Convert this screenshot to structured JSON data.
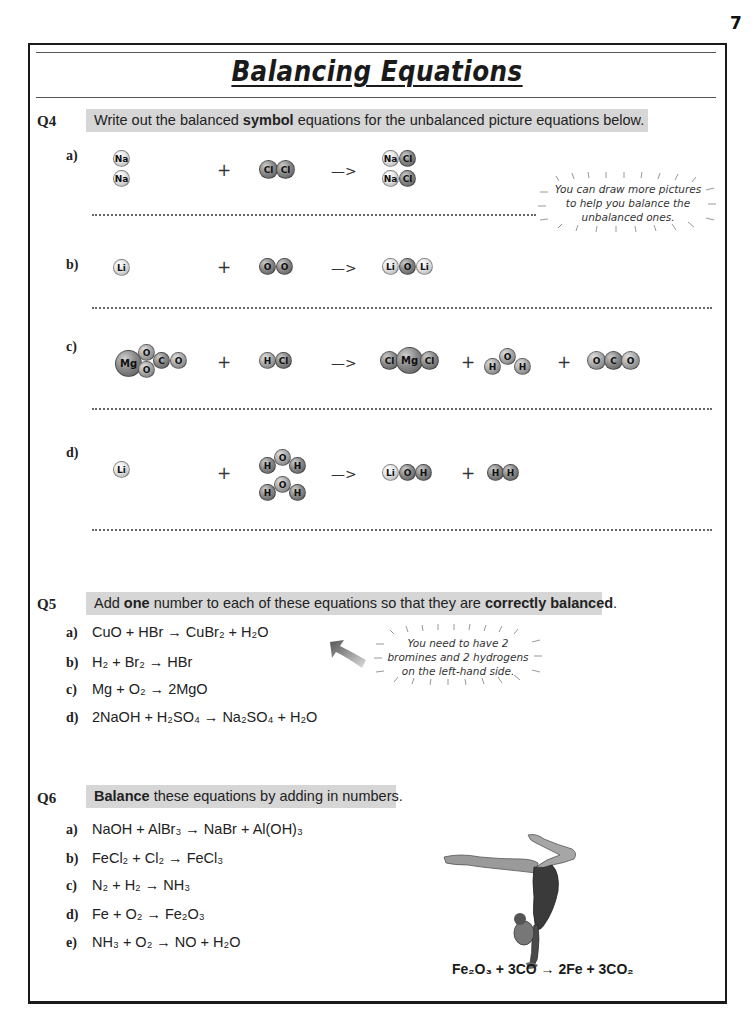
{
  "page_number": "7",
  "title": "Balancing Equations",
  "q4": {
    "label": "Q4",
    "instruction_pre": "Write out the balanced ",
    "instruction_bold": "symbol",
    "instruction_post": " equations for the unbalanced picture equations below.",
    "parts": [
      {
        "label": "a)",
        "reactants": [
          [
            "Na"
          ],
          [
            "Na"
          ]
        ],
        "reactant2": [
          "Cl",
          "Cl"
        ],
        "products": [
          [
            "Na",
            "Cl"
          ],
          [
            "Na",
            "Cl"
          ]
        ]
      },
      {
        "label": "b)",
        "reactants": [
          [
            "Li"
          ]
        ],
        "reactant2": [
          "O",
          "O"
        ],
        "products": [
          [
            "Li",
            "O",
            "Li"
          ]
        ]
      },
      {
        "label": "c)",
        "reactants": [
          [
            "Mg",
            "O",
            "O",
            "C",
            "O"
          ]
        ],
        "reactant2": [
          "H",
          "Cl"
        ],
        "products": [
          [
            "Cl",
            "Mg",
            "Cl"
          ],
          [
            "H",
            "O",
            "H"
          ],
          [
            "O",
            "C",
            "O"
          ]
        ]
      },
      {
        "label": "d)",
        "reactants": [
          [
            "Li"
          ]
        ],
        "reactant2": [
          [
            "H",
            "O",
            "H"
          ],
          [
            "H",
            "O",
            "H"
          ]
        ],
        "products": [
          [
            "Li",
            "O",
            "H"
          ],
          [
            "H",
            "H"
          ]
        ]
      }
    ],
    "plus": "+",
    "arrow": "—>",
    "note_lines": [
      "You can draw more pictures",
      "to help you balance the",
      "unbalanced ones."
    ]
  },
  "q5": {
    "label": "Q5",
    "instruction_pre": "Add ",
    "instruction_bold1": "one",
    "instruction_mid": " number to each of these equations so that they are ",
    "instruction_bold2": "correctly balanced",
    "instruction_post": ".",
    "items": [
      {
        "label": "a)",
        "equation": "CuO + HBr → CuBr₂ + H₂O"
      },
      {
        "label": "b)",
        "equation": "H₂ + Br₂ → HBr"
      },
      {
        "label": "c)",
        "equation": "Mg + O₂ → 2MgO"
      },
      {
        "label": "d)",
        "equation": "2NaOH + H₂SO₄ → Na₂SO₄ + H₂O"
      }
    ],
    "note_lines": [
      "You need to have 2",
      "bromines and 2 hydrogens",
      "on the left-hand side."
    ]
  },
  "q6": {
    "label": "Q6",
    "instruction_bold": "Balance",
    "instruction_post": " these equations by adding in numbers.",
    "items": [
      {
        "label": "a)",
        "equation": "NaOH + AlBr₃ → NaBr + Al(OH)₃"
      },
      {
        "label": "b)",
        "equation": "FeCl₂ + Cl₂ → FeCl₃"
      },
      {
        "label": "c)",
        "equation": "N₂ + H₂ → NH₃"
      },
      {
        "label": "d)",
        "equation": "Fe + O₂ → Fe₂O₃"
      },
      {
        "label": "e)",
        "equation": "NH₃ + O₂ → NO + H₂O"
      }
    ],
    "illustration": "gymnast-handstand",
    "caption": "Fe₂O₃ + 3CO → 2Fe + 3CO₂"
  },
  "colors": {
    "banner_bg": "#d6d6d6",
    "frame": "#1a1a1a",
    "text": "#222222"
  }
}
